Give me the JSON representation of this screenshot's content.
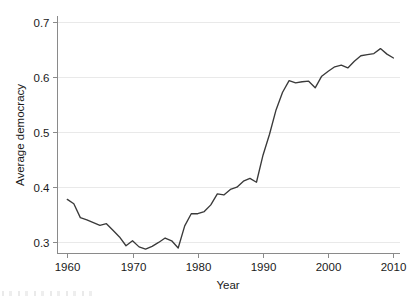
{
  "chart_data": {
    "type": "line",
    "title": "",
    "subtitle": "",
    "xlabel": "Year",
    "ylabel": "Average democracy",
    "xlim": [
      1958.5,
      2011.0
    ],
    "ylim": [
      0.28,
      0.71
    ],
    "xticks": [
      1960,
      1970,
      1980,
      1990,
      2000,
      2010
    ],
    "xtick_labels": [
      "1960",
      "1970",
      "1980",
      "1990",
      "2000",
      "2010"
    ],
    "yticks": [
      0.3,
      0.4,
      0.5,
      0.6,
      0.7
    ],
    "ytick_labels": [
      "0.3",
      "0.4",
      "0.5",
      "0.6",
      "0.7"
    ],
    "grid": "horizontal",
    "legend": "none",
    "line_color": "#3a3a3a",
    "grid_color": "#e9e9e9",
    "axis_color": "#8a8a8a",
    "series": [
      {
        "name": "Average democracy",
        "x": [
          1960,
          1961,
          1962,
          1963,
          1964,
          1965,
          1966,
          1967,
          1968,
          1969,
          1970,
          1971,
          1972,
          1973,
          1974,
          1975,
          1976,
          1977,
          1978,
          1979,
          1980,
          1981,
          1982,
          1983,
          1984,
          1985,
          1986,
          1987,
          1988,
          1989,
          1990,
          1991,
          1992,
          1993,
          1994,
          1995,
          1996,
          1997,
          1998,
          1999,
          2000,
          2001,
          2002,
          2003,
          2004,
          2005,
          2006,
          2007,
          2008,
          2009,
          2010
        ],
        "values": [
          0.378,
          0.37,
          0.345,
          0.341,
          0.336,
          0.331,
          0.334,
          0.322,
          0.31,
          0.294,
          0.303,
          0.292,
          0.288,
          0.293,
          0.3,
          0.308,
          0.303,
          0.29,
          0.33,
          0.352,
          0.352,
          0.356,
          0.368,
          0.388,
          0.386,
          0.396,
          0.4,
          0.411,
          0.416,
          0.409,
          0.458,
          0.496,
          0.54,
          0.572,
          0.593,
          0.589,
          0.591,
          0.592,
          0.58,
          0.601,
          0.61,
          0.618,
          0.621,
          0.616,
          0.628,
          0.638,
          0.64,
          0.642,
          0.651,
          0.641,
          0.634
        ]
      }
    ],
    "notes": {
      "trough_year": 1972,
      "trough_value": 0.288,
      "peak_year": 2008,
      "peak_value": 0.651,
      "start_value": 0.378,
      "end_value": 0.634
    }
  },
  "axis": {
    "x_title": "Year",
    "y_title": "Average democracy"
  }
}
